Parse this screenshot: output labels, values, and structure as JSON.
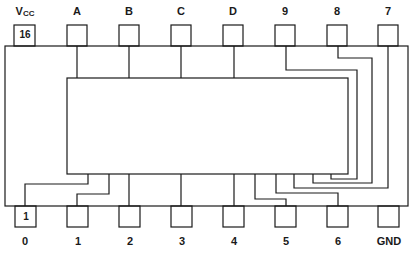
{
  "diagram": {
    "type": "IC pinout (16-pin DIP, top view)",
    "line_color": "#1a1a1a",
    "top_pins": [
      {
        "label": "V",
        "label_sub": "CC",
        "number": "16",
        "x": 14
      },
      {
        "label": "A",
        "number": "",
        "x": 67
      },
      {
        "label": "B",
        "number": "",
        "x": 119
      },
      {
        "label": "C",
        "number": "",
        "x": 171
      },
      {
        "label": "D",
        "number": "",
        "x": 223
      },
      {
        "label": "9",
        "number": "",
        "x": 275
      },
      {
        "label": "8",
        "number": "",
        "x": 327
      },
      {
        "label": "7",
        "number": "",
        "x": 378
      }
    ],
    "bottom_pins": [
      {
        "label": "0",
        "number": "1",
        "x": 14
      },
      {
        "label": "1",
        "number": "",
        "x": 67
      },
      {
        "label": "2",
        "number": "",
        "x": 119
      },
      {
        "label": "3",
        "number": "",
        "x": 171
      },
      {
        "label": "4",
        "number": "",
        "x": 223
      },
      {
        "label": "5",
        "number": "",
        "x": 275
      },
      {
        "label": "6",
        "number": "",
        "x": 327
      },
      {
        "label": "GND",
        "number": "",
        "x": 378
      }
    ]
  }
}
